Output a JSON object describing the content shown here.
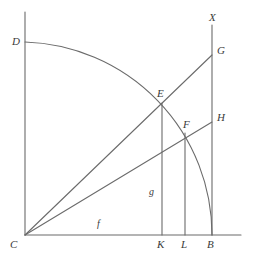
{
  "figure": {
    "width": 257,
    "height": 260,
    "background_color": "#ffffff",
    "stroke_color": "#6b6b6b",
    "label_color": "#3a3a3a"
  },
  "points": [
    {
      "id": "D",
      "label": "D",
      "x": 25,
      "y": 42,
      "label_x": 12,
      "label_y": 36
    },
    {
      "id": "X",
      "label": "X",
      "x": 212,
      "y": 25,
      "label_x": 209,
      "label_y": 12
    },
    {
      "id": "G",
      "label": "G",
      "x": 212,
      "y": 55,
      "label_x": 217,
      "label_y": 45
    },
    {
      "id": "E",
      "label": "E",
      "x": 162,
      "y": 103,
      "label_x": 157,
      "label_y": 88
    },
    {
      "id": "H",
      "label": "H",
      "x": 212,
      "y": 122,
      "label_x": 217,
      "label_y": 112
    },
    {
      "id": "F",
      "label": "F",
      "x": 188,
      "y": 133,
      "label_x": 183,
      "label_y": 119
    },
    {
      "id": "C",
      "label": "C",
      "x": 25,
      "y": 235,
      "label_x": 10,
      "label_y": 239
    },
    {
      "id": "K",
      "label": "K",
      "x": 162,
      "y": 235,
      "label_x": 157,
      "label_y": 239
    },
    {
      "id": "L",
      "label": "L",
      "x": 185,
      "y": 235,
      "label_x": 181,
      "label_y": 239
    },
    {
      "id": "B",
      "label": "B",
      "x": 212,
      "y": 235,
      "label_x": 207,
      "label_y": 239
    }
  ],
  "segment_labels": [
    {
      "id": "g",
      "label": "g",
      "label_x": 149,
      "label_y": 187,
      "describes": "vertical-segment-EK"
    },
    {
      "id": "f",
      "label": "f",
      "label_x": 97,
      "label_y": 219,
      "describes": "baseline-segment-CK"
    }
  ],
  "lines": [
    {
      "id": "baseline",
      "name": "horizontal-baseline-CB",
      "x1": 25,
      "y1": 235,
      "x2": 241,
      "y2": 235
    },
    {
      "id": "left-vertical",
      "name": "vertical-axis-CD",
      "x1": 25,
      "y1": 12,
      "x2": 25,
      "y2": 235
    },
    {
      "id": "right-vertical",
      "name": "vertical-axis-XB",
      "x1": 212,
      "y1": 25,
      "x2": 212,
      "y2": 235
    },
    {
      "id": "ray-CG",
      "name": "ray-C-to-G",
      "x1": 25,
      "y1": 235,
      "x2": 212,
      "y2": 55
    },
    {
      "id": "ray-CH",
      "name": "ray-C-to-H",
      "x1": 25,
      "y1": 235,
      "x2": 212,
      "y2": 122
    },
    {
      "id": "ordinate-EK",
      "name": "ordinate-E-to-K",
      "x1": 162,
      "y1": 103,
      "x2": 162,
      "y2": 235
    },
    {
      "id": "ordinate-FL",
      "name": "ordinate-F-to-L",
      "x1": 185,
      "y1": 133,
      "x2": 185,
      "y2": 235
    }
  ],
  "arc": {
    "id": "arc-DEFB",
    "name": "quarter-circle-arc-D-E-F-B",
    "center_x": 25,
    "center_y": 235,
    "radius": 193,
    "start_x": 25,
    "start_y": 42,
    "end_x": 212,
    "end_y": 235,
    "path": "M 25 42 A 193 193 0 0 1 212 235"
  }
}
